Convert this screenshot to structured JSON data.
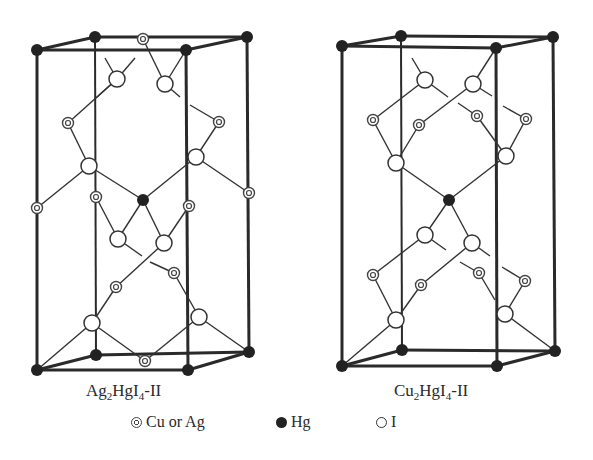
{
  "figure": {
    "structures": [
      {
        "caption": "Ag₂HgI₄-II",
        "caption_parts": {
          "a": "Ag",
          "s1": "2",
          "b": "HgI",
          "s2": "4",
          "c": "-II"
        },
        "frame": {
          "top": [
            [
              37,
              50
            ],
            [
              95,
              37
            ],
            [
              247,
              37
            ],
            [
              186,
              50
            ]
          ],
          "bottom": [
            [
              37,
              370
            ],
            [
              96,
              355
            ],
            [
              249,
              352
            ],
            [
              188,
              370
            ]
          ]
        },
        "hg_corners": [
          [
            37,
            50
          ],
          [
            95,
            37
          ],
          [
            247,
            37
          ],
          [
            186,
            50
          ],
          [
            37,
            370
          ],
          [
            96,
            355
          ],
          [
            249,
            352
          ],
          [
            188,
            370
          ]
        ],
        "hg_center": [
          143,
          200
        ],
        "iodine": [
          [
            117,
            79
          ],
          [
            165,
            84
          ],
          [
            89,
            166
          ],
          [
            196,
            157
          ],
          [
            118,
            239
          ],
          [
            164,
            243
          ],
          [
            92,
            323
          ],
          [
            199,
            317
          ]
        ],
        "cu_ag": [
          [
            143,
            39
          ],
          [
            68,
            123
          ],
          [
            219,
            122
          ],
          [
            96,
            197
          ],
          [
            189,
            206
          ],
          [
            37,
            208
          ],
          [
            249,
            193
          ],
          [
            116,
            287
          ],
          [
            174,
            273
          ],
          [
            145,
            361
          ]
        ],
        "bonds": [
          [
            [
              117,
              79
            ],
            [
              105,
              58
            ]
          ],
          [
            [
              117,
              79
            ],
            [
              135,
              58
            ]
          ],
          [
            [
              165,
              84
            ],
            [
              143,
              39
            ]
          ],
          [
            [
              165,
              84
            ],
            [
              186,
              50
            ]
          ],
          [
            [
              165,
              84
            ],
            [
              180,
              97
            ]
          ],
          [
            [
              117,
              79
            ],
            [
              96,
              98
            ]
          ],
          [
            [
              117,
              79
            ],
            [
              68,
              123
            ]
          ],
          [
            [
              68,
              123
            ],
            [
              89,
              166
            ]
          ],
          [
            [
              89,
              166
            ],
            [
              37,
              208
            ]
          ],
          [
            [
              89,
              166
            ],
            [
              143,
              200
            ]
          ],
          [
            [
              196,
              157
            ],
            [
              219,
              122
            ]
          ],
          [
            [
              219,
              122
            ],
            [
              190,
              105
            ]
          ],
          [
            [
              196,
              157
            ],
            [
              249,
              193
            ]
          ],
          [
            [
              196,
              157
            ],
            [
              143,
              200
            ]
          ],
          [
            [
              143,
              200
            ],
            [
              118,
              239
            ]
          ],
          [
            [
              143,
              200
            ],
            [
              164,
              243
            ]
          ],
          [
            [
              118,
              239
            ],
            [
              96,
              197
            ]
          ],
          [
            [
              164,
              243
            ],
            [
              189,
              206
            ]
          ],
          [
            [
              118,
              239
            ],
            [
              142,
              256
            ]
          ],
          [
            [
              150,
              262
            ],
            [
              174,
              273
            ]
          ],
          [
            [
              174,
              273
            ],
            [
              199,
              317
            ]
          ],
          [
            [
              164,
              243
            ],
            [
              116,
              287
            ]
          ],
          [
            [
              116,
              287
            ],
            [
              92,
              323
            ]
          ],
          [
            [
              92,
              323
            ],
            [
              37,
              370
            ]
          ],
          [
            [
              92,
              323
            ],
            [
              145,
              361
            ]
          ],
          [
            [
              199,
              317
            ],
            [
              145,
              361
            ]
          ],
          [
            [
              199,
              317
            ],
            [
              249,
              352
            ]
          ]
        ]
      },
      {
        "caption": "Cu₂HgI₄-II",
        "caption_parts": {
          "a": "Cu",
          "s1": "2",
          "b": "HgI",
          "s2": "4",
          "c": "-II"
        },
        "frame": {
          "top": [
            [
              342,
              46
            ],
            [
              401,
              36
            ],
            [
              553,
              37
            ],
            [
              496,
              48
            ]
          ],
          "bottom": [
            [
              342,
              366
            ],
            [
              402,
              350
            ],
            [
              555,
              351
            ],
            [
              497,
              366
            ]
          ]
        },
        "hg_corners": [
          [
            342,
            46
          ],
          [
            401,
            36
          ],
          [
            553,
            37
          ],
          [
            496,
            48
          ],
          [
            342,
            366
          ],
          [
            402,
            350
          ],
          [
            555,
            351
          ],
          [
            497,
            366
          ]
        ],
        "hg_center": [
          449,
          200
        ],
        "iodine": [
          [
            425,
            80
          ],
          [
            473,
            84
          ],
          [
            396,
            163
          ],
          [
            506,
            156
          ],
          [
            425,
            235
          ],
          [
            472,
            243
          ],
          [
            396,
            320
          ],
          [
            505,
            314
          ]
        ],
        "cu_ag": [
          [
            373,
            120
          ],
          [
            419,
            125
          ],
          [
            477,
            116
          ],
          [
            526,
            119
          ],
          [
            373,
            275
          ],
          [
            421,
            285
          ],
          [
            479,
            273
          ],
          [
            525,
            281
          ]
        ],
        "bonds": [
          [
            [
              425,
              80
            ],
            [
              412,
              58
            ]
          ],
          [
            [
              473,
              84
            ],
            [
              496,
              48
            ]
          ],
          [
            [
              425,
              80
            ],
            [
              373,
              120
            ]
          ],
          [
            [
              425,
              80
            ],
            [
              448,
              97
            ]
          ],
          [
            [
              473,
              84
            ],
            [
              419,
              125
            ]
          ],
          [
            [
              473,
              84
            ],
            [
              492,
              96
            ]
          ],
          [
            [
              458,
              103
            ],
            [
              477,
              116
            ]
          ],
          [
            [
              503,
              106
            ],
            [
              526,
              119
            ]
          ],
          [
            [
              373,
              120
            ],
            [
              396,
              163
            ]
          ],
          [
            [
              419,
              125
            ],
            [
              396,
              163
            ]
          ],
          [
            [
              477,
              116
            ],
            [
              506,
              156
            ]
          ],
          [
            [
              526,
              119
            ],
            [
              506,
              156
            ]
          ],
          [
            [
              396,
              163
            ],
            [
              449,
              200
            ]
          ],
          [
            [
              506,
              156
            ],
            [
              449,
              200
            ]
          ],
          [
            [
              449,
              200
            ],
            [
              425,
              235
            ]
          ],
          [
            [
              449,
              200
            ],
            [
              472,
              243
            ]
          ],
          [
            [
              425,
              235
            ],
            [
              373,
              275
            ]
          ],
          [
            [
              425,
              235
            ],
            [
              446,
              250
            ]
          ],
          [
            [
              472,
              243
            ],
            [
              421,
              285
            ]
          ],
          [
            [
              472,
              243
            ],
            [
              490,
              256
            ]
          ],
          [
            [
              460,
              262
            ],
            [
              479,
              273
            ]
          ],
          [
            [
              502,
              267
            ],
            [
              525,
              281
            ]
          ],
          [
            [
              373,
              275
            ],
            [
              396,
              320
            ]
          ],
          [
            [
              421,
              285
            ],
            [
              396,
              320
            ]
          ],
          [
            [
              479,
              273
            ],
            [
              495,
              300
            ]
          ],
          [
            [
              525,
              281
            ],
            [
              505,
              314
            ]
          ],
          [
            [
              396,
              320
            ],
            [
              342,
              366
            ]
          ],
          [
            [
              505,
              314
            ],
            [
              555,
              351
            ]
          ]
        ]
      }
    ],
    "legend": [
      {
        "symbol": "cu-ag",
        "label": "Cu or Ag"
      },
      {
        "symbol": "hg",
        "label": "Hg"
      },
      {
        "symbol": "i",
        "label": "I"
      }
    ]
  }
}
